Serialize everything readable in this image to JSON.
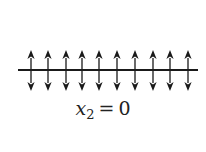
{
  "diagram": {
    "line": {
      "x_start": 18,
      "x_end": 198,
      "y": 70,
      "color": "#1a1a1a",
      "width": 2.2
    },
    "arrows": {
      "count": 10,
      "x_positions": [
        31,
        48,
        66,
        82,
        99,
        117,
        135,
        153,
        170,
        188
      ],
      "y_top": 50,
      "y_bottom": 91,
      "direction": "both",
      "color": "#1a1a1a"
    },
    "label": {
      "variable": "x",
      "subscript": "2",
      "equals": "=",
      "value": "0",
      "full_text": "x2 = 0"
    }
  }
}
